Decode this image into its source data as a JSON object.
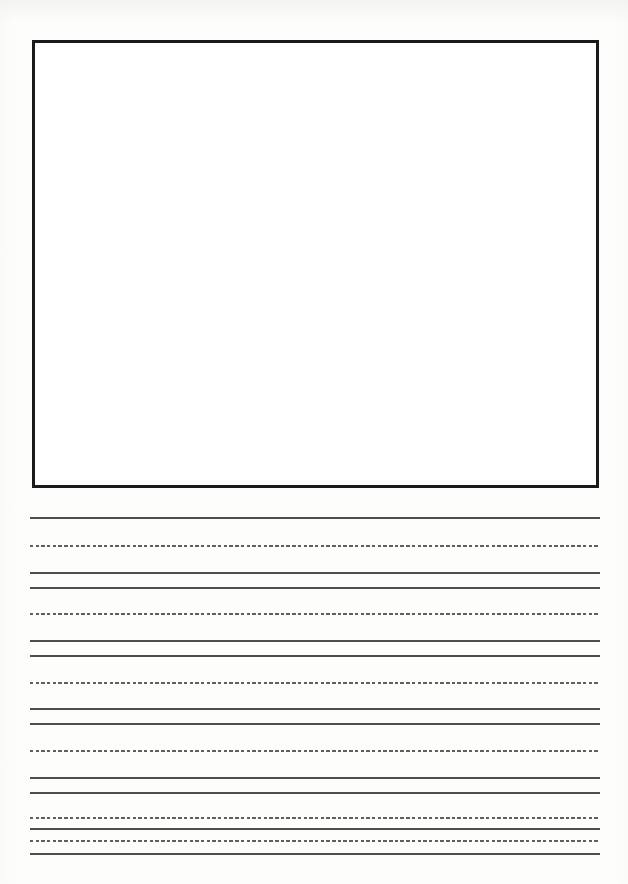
{
  "document": {
    "type": "handwriting-practice-worksheet",
    "title": "",
    "page_width": 628,
    "page_height": 884,
    "background_color": "#fdfdfc",
    "has_visible_text": false
  },
  "drawing_box": {
    "label": "",
    "x": 32,
    "y": 40,
    "width": 567,
    "height": 448,
    "border_width": 3,
    "border_color": "#1a1a1a",
    "fill_color": "#ffffff",
    "content": ""
  },
  "writing_area": {
    "left": 30,
    "right": 600,
    "line_width": 570,
    "solid_color": "#4e4e4e",
    "dashed_color": "#5f5f5f",
    "solid_thickness": 2,
    "dashed_thickness": 1.8,
    "dash_length": 3.4,
    "dash_gap": 2.3,
    "group_count": 6,
    "groups": [
      {
        "index": 1,
        "top_line_y": 517,
        "mid_line_y": 545,
        "base_line_y": 572,
        "text": ""
      },
      {
        "index": 2,
        "top_line_y": 587,
        "mid_line_y": 613,
        "base_line_y": 640,
        "text": ""
      },
      {
        "index": 3,
        "top_line_y": 655,
        "mid_line_y": 682,
        "base_line_y": 708,
        "text": ""
      },
      {
        "index": 4,
        "top_line_y": 723,
        "mid_line_y": 750,
        "base_line_y": 777,
        "text": ""
      },
      {
        "index": 5,
        "top_line_y": 792,
        "mid_line_y": 817,
        "base_line_y": 828,
        "text": ""
      },
      {
        "index": 6,
        "top_line_y": 828,
        "mid_line_y": 840,
        "base_line_y": 853,
        "text": ""
      }
    ],
    "all_rules": [
      {
        "y": 517,
        "style": "solid"
      },
      {
        "y": 545,
        "style": "dashed"
      },
      {
        "y": 572,
        "style": "solid"
      },
      {
        "y": 587,
        "style": "solid"
      },
      {
        "y": 613,
        "style": "dashed"
      },
      {
        "y": 640,
        "style": "solid"
      },
      {
        "y": 655,
        "style": "solid"
      },
      {
        "y": 682,
        "style": "dashed"
      },
      {
        "y": 708,
        "style": "solid"
      },
      {
        "y": 723,
        "style": "solid"
      },
      {
        "y": 750,
        "style": "dashed"
      },
      {
        "y": 777,
        "style": "solid"
      },
      {
        "y": 792,
        "style": "solid"
      },
      {
        "y": 817,
        "style": "dashed"
      },
      {
        "y": 828,
        "style": "solid"
      },
      {
        "y": 840,
        "style": "dashed"
      },
      {
        "y": 853,
        "style": "solid"
      }
    ]
  }
}
